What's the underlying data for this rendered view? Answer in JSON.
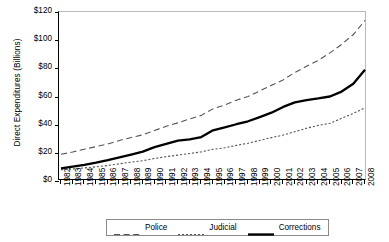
{
  "chart_data": {
    "type": "line",
    "title": "",
    "xlabel": "",
    "ylabel": "Direct Expenditures (Billions)",
    "ylim": [
      0,
      120
    ],
    "ytick_labels": [
      "$120",
      "$100",
      "$80",
      "$60",
      "$40",
      "$20",
      "$0"
    ],
    "ytick_values": [
      120,
      100,
      80,
      60,
      40,
      20,
      0
    ],
    "grid": false,
    "legend_position": "bottom",
    "x": [
      1982,
      1983,
      1984,
      1985,
      1986,
      1987,
      1988,
      1989,
      1990,
      1991,
      1992,
      1993,
      1994,
      1995,
      1996,
      1997,
      1998,
      1999,
      2000,
      2001,
      2002,
      2003,
      2004,
      2005,
      2006,
      2007,
      2008
    ],
    "categories": [
      "1982",
      "1983",
      "1984",
      "1985",
      "1986",
      "1987",
      "1988",
      "1989",
      "1990",
      "1991",
      "1992",
      "1993",
      "1994",
      "1995",
      "1996",
      "1997",
      "1998",
      "1999",
      "2000",
      "2001",
      "2002",
      "2003",
      "2004",
      "2005",
      "2006",
      "2007",
      "2008"
    ],
    "series": [
      {
        "name": "Police",
        "style": "dashed",
        "color": "#555555",
        "values": [
          19.0,
          20.6,
          22.6,
          24.4,
          26.3,
          28.8,
          30.9,
          32.8,
          35.9,
          38.9,
          41.3,
          44.1,
          46.6,
          51.2,
          54.0,
          57.4,
          60.0,
          64.0,
          68.0,
          71.8,
          77.0,
          81.5,
          85.6,
          91.0,
          97.0,
          104.0,
          114.0
        ]
      },
      {
        "name": "Judicial",
        "style": "dotted",
        "color": "#555555",
        "values": [
          8.0,
          8.6,
          9.3,
          10.1,
          11.0,
          12.2,
          13.4,
          14.4,
          16.0,
          17.3,
          18.4,
          19.5,
          20.7,
          22.5,
          23.6,
          25.3,
          26.8,
          28.8,
          30.8,
          32.6,
          35.0,
          37.5,
          39.5,
          41.0,
          44.5,
          48.0,
          52.0
        ]
      },
      {
        "name": "Corrections",
        "style": "solid",
        "color": "#000000",
        "values": [
          9.0,
          10.2,
          11.5,
          13.0,
          14.8,
          16.8,
          18.8,
          20.9,
          24.0,
          26.4,
          28.6,
          29.6,
          31.2,
          36.0,
          38.0,
          40.3,
          42.4,
          45.4,
          48.5,
          52.6,
          55.8,
          57.4,
          58.6,
          60.0,
          63.5,
          69.0,
          79.0
        ]
      }
    ]
  },
  "legend": {
    "items": [
      {
        "label": "Police"
      },
      {
        "label": "Judicial"
      },
      {
        "label": "Corrections"
      }
    ]
  }
}
